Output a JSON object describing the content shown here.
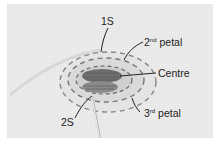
{
  "image": {
    "subject": "embroidery stitch on linen fabric with needle",
    "annotations": [
      {
        "id": "1s",
        "text": "1S"
      },
      {
        "id": "petal2",
        "num": "2",
        "sup": "nd",
        "word": "petal"
      },
      {
        "id": "centre",
        "text": "Centre"
      },
      {
        "id": "petal3",
        "num": "3",
        "sup": "rd",
        "word": "petal"
      },
      {
        "id": "2s",
        "text": "2S"
      }
    ]
  }
}
